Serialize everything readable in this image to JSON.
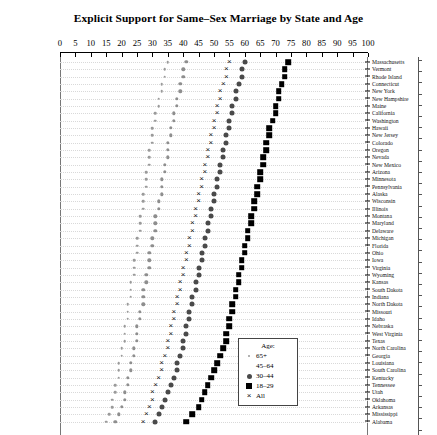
{
  "chart_data": {
    "type": "scatter",
    "title": "Explicit Support for Same–Sex Marriage by State and Age",
    "xlabel": "",
    "ylabel": "",
    "xlim": [
      0,
      100
    ],
    "grid": true,
    "legend_position": "bottom-center-inside",
    "xticks": [
      0,
      5,
      10,
      15,
      20,
      25,
      30,
      35,
      40,
      45,
      50,
      55,
      60,
      65,
      70,
      75,
      80,
      85,
      90,
      95,
      100
    ],
    "legend_title": "Age:",
    "series": [
      {
        "name": "65+",
        "marker": "small-dot",
        "color": "#9a9a9a"
      },
      {
        "name": "45–64",
        "marker": "dot",
        "color": "#8e8e8e"
      },
      {
        "name": "30–44",
        "marker": "filled-circle",
        "color": "#4a4a4a"
      },
      {
        "name": "18–29",
        "marker": "filled-square",
        "color": "#000000"
      },
      {
        "name": "All",
        "marker": "cross",
        "color": "#111111"
      }
    ],
    "categories": [
      "Massachusetts",
      "Vermont",
      "Rhode Island",
      "Connecticut",
      "New York",
      "New Hampshire",
      "Maine",
      "California",
      "Washington",
      "Hawaii",
      "New Jersey",
      "Colorado",
      "Oregon",
      "Nevada",
      "New Mexico",
      "Arizona",
      "Minnesota",
      "Pennsylvania",
      "Alaska",
      "Wisconsin",
      "Illinois",
      "Montana",
      "Maryland",
      "Delaware",
      "Michigan",
      "Florida",
      "Ohio",
      "Iowa",
      "Virginia",
      "Wyoming",
      "Kansas",
      "South Dakota",
      "Indiana",
      "North Dakota",
      "Missouri",
      "Idaho",
      "Nebraska",
      "West Virginia",
      "Texas",
      "North Carolina",
      "Georgia",
      "Louisiana",
      "South Carolina",
      "Kentucky",
      "Tennessee",
      "Utah",
      "Oklahoma",
      "Arkansas",
      "Mississippi",
      "Alabama"
    ],
    "values": {
      "65+": [
        35,
        34,
        34,
        33,
        33,
        32,
        32,
        31,
        31,
        30,
        30,
        30,
        29,
        29,
        29,
        28,
        28,
        28,
        27,
        27,
        27,
        26,
        26,
        26,
        25,
        25,
        25,
        24,
        24,
        24,
        23,
        23,
        23,
        22,
        22,
        22,
        21,
        21,
        21,
        20,
        20,
        19,
        19,
        19,
        18,
        18,
        17,
        17,
        16,
        15
      ],
      "45–64": [
        41,
        40,
        40,
        39,
        39,
        38,
        38,
        37,
        37,
        36,
        36,
        35,
        35,
        35,
        34,
        34,
        33,
        33,
        33,
        32,
        32,
        31,
        31,
        31,
        30,
        30,
        29,
        29,
        29,
        28,
        28,
        27,
        27,
        27,
        26,
        26,
        25,
        25,
        25,
        24,
        24,
        23,
        23,
        22,
        22,
        21,
        21,
        20,
        19,
        18
      ],
      "30–44": [
        60,
        59,
        59,
        58,
        57,
        57,
        56,
        56,
        55,
        55,
        54,
        54,
        53,
        53,
        52,
        52,
        51,
        51,
        50,
        50,
        49,
        49,
        48,
        48,
        47,
        47,
        46,
        46,
        45,
        45,
        44,
        44,
        43,
        43,
        42,
        42,
        41,
        41,
        40,
        40,
        39,
        38,
        38,
        37,
        36,
        35,
        34,
        33,
        32,
        31
      ],
      "18–29": [
        74,
        73,
        73,
        72,
        71,
        71,
        70,
        70,
        69,
        68,
        68,
        67,
        67,
        66,
        66,
        65,
        65,
        64,
        64,
        63,
        63,
        62,
        62,
        61,
        61,
        60,
        60,
        59,
        59,
        58,
        58,
        57,
        57,
        56,
        56,
        55,
        55,
        54,
        54,
        53,
        52,
        51,
        50,
        49,
        48,
        47,
        46,
        45,
        43,
        41
      ],
      "All": [
        55,
        54,
        54,
        53,
        52,
        52,
        51,
        51,
        50,
        50,
        49,
        49,
        48,
        48,
        47,
        47,
        46,
        46,
        45,
        45,
        44,
        44,
        43,
        43,
        42,
        42,
        41,
        41,
        40,
        40,
        39,
        39,
        38,
        38,
        37,
        37,
        36,
        36,
        35,
        35,
        34,
        33,
        33,
        32,
        31,
        30,
        30,
        29,
        28,
        27
      ]
    }
  },
  "legend": {
    "title": "Age:",
    "items": [
      {
        "label": "65+",
        "key": "pt-65"
      },
      {
        "label": "45–64",
        "key": "pt-4564"
      },
      {
        "label": "30–44",
        "key": "pt-3044"
      },
      {
        "label": "18–29",
        "key": "pt-1829"
      },
      {
        "label": "All",
        "key": "pt-all"
      }
    ]
  }
}
